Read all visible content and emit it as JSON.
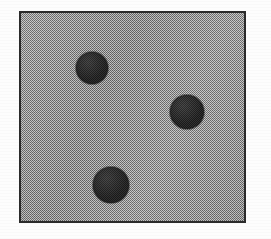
{
  "figure": {
    "canvas": {
      "width_px": 271,
      "height_px": 239,
      "background_color": "#fdfdfd"
    },
    "plate": {
      "name": "gray-textured-square",
      "left_px": 19,
      "top_px": 11,
      "width_px": 227,
      "height_px": 212,
      "fill_color": "#9a9a9a",
      "border_color": "#2b2b2b",
      "border_width_px": 2,
      "texture": "halftone-dither"
    },
    "dots": [
      {
        "id": "dot-1",
        "label": "top-left-dot",
        "center_x_px": 90,
        "center_y_px": 66,
        "radius_px": 16,
        "fill_color": "#1e1e1e"
      },
      {
        "id": "dot-2",
        "label": "middle-right-dot",
        "center_x_px": 185,
        "center_y_px": 110,
        "radius_px": 17,
        "fill_color": "#1e1e1e"
      },
      {
        "id": "dot-3",
        "label": "bottom-left-dot",
        "center_x_px": 109,
        "center_y_px": 183,
        "radius_px": 18,
        "fill_color": "#1e1e1e"
      }
    ]
  }
}
